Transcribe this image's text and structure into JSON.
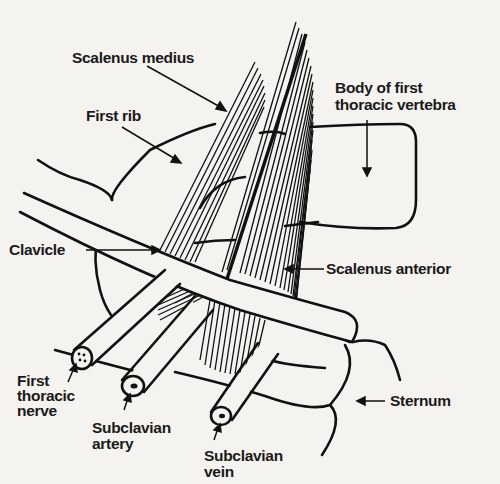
{
  "diagram": {
    "colors": {
      "ink": "#111111",
      "paper": "#f4f3f0"
    },
    "labels": {
      "scalenus_medius": "Scalenus medius",
      "first_rib": "First rib",
      "body_vertebra_line1": "Body of first",
      "body_vertebra_line2": "thoracic vertebra",
      "clavicle": "Clavicle",
      "scalenus_anterior": "Scalenus anterior",
      "first_thoracic_nerve_line1": "First",
      "first_thoracic_nerve_line2": "thoracic",
      "first_thoracic_nerve_line3": "nerve",
      "subclavian_artery_line1": "Subclavian",
      "subclavian_artery_line2": "artery",
      "subclavian_vein_line1": "Subclavian",
      "subclavian_vein_line2": "vein",
      "sternum": "Sternum"
    }
  }
}
